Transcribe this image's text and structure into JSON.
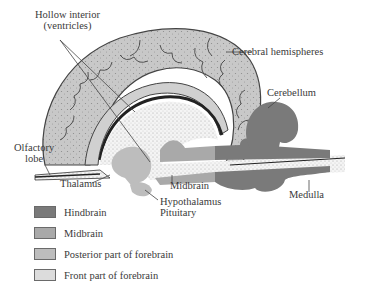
{
  "labels": {
    "hollow_interior": "Hollow interior",
    "ventricles": "(ventricles)",
    "cerebral_hemispheres": "Cerebral hemispheres",
    "cerebellum": "Cerebellum",
    "olfactory": "Olfactory",
    "lobe": "lobe",
    "thalamus": "Thalamus",
    "midbrain": "Midbrain",
    "hypothalamus": "Hypothalamus",
    "pituitary": "Pituitary",
    "medulla": "Medulla"
  },
  "legend": [
    {
      "label": "Hindbrain",
      "color": "#7a7a7a"
    },
    {
      "label": "Midbrain",
      "color": "#a9a9a9"
    },
    {
      "label": "Posterior part of forebrain",
      "color": "#bdbdbd"
    },
    {
      "label": "Front part of forebrain",
      "color": "#dcdcdc"
    }
  ]
}
